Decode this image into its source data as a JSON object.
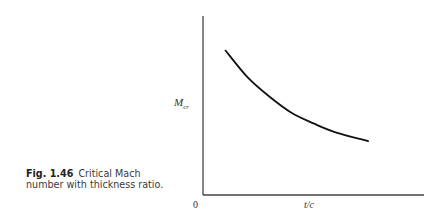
{
  "caption": {
    "figure_number": "Fig. 1.46",
    "text": "Critical Mach number with thickness ratio."
  },
  "colors": {
    "axis": "#444444",
    "curve": "#111111",
    "text": "#333333"
  },
  "chart_data": {
    "type": "line",
    "title": "",
    "xlabel": "t/c",
    "ylabel": "M_cr",
    "ylabel_main": "M",
    "ylabel_sub": "cr",
    "origin_label": "0",
    "grid": false,
    "legend": null,
    "xlim": [
      0,
      1
    ],
    "ylim": [
      0,
      1
    ],
    "series": [
      {
        "name": "M_cr vs t/c",
        "x": [
          0.1,
          0.2,
          0.3,
          0.4,
          0.5,
          0.6,
          0.75
        ],
        "y": [
          0.81,
          0.66,
          0.55,
          0.46,
          0.4,
          0.35,
          0.3
        ]
      }
    ],
    "annotations": [
      "Qualitative curve: critical Mach number decreases as thickness ratio increases; no numeric ticks shown"
    ]
  }
}
